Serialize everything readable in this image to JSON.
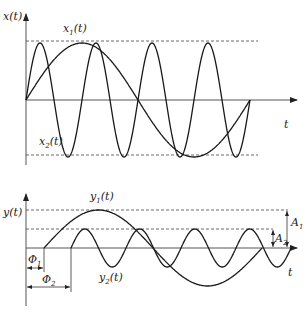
{
  "top_plot": {
    "y_axis_label": "x(t)",
    "x_axis_label": "t",
    "curves": [
      {
        "name": "x1(t)",
        "label_base": "x",
        "label_sub": "1",
        "label_suffix": "(t)",
        "description": "low-frequency sine, one full period"
      },
      {
        "name": "x2(t)",
        "label_base": "x",
        "label_sub": "2",
        "label_suffix": "(t)",
        "description": "high-frequency sine, four periods, same amplitude"
      }
    ]
  },
  "bottom_plot": {
    "y_axis_label": "y(t)",
    "x_axis_label": "t",
    "curves": [
      {
        "name": "y1(t)",
        "label_base": "y",
        "label_sub": "1",
        "label_suffix": "(t)",
        "description": "low-frequency sine, amplitude A1, delayed by Φ1"
      },
      {
        "name": "y2(t)",
        "label_base": "y",
        "label_sub": "2",
        "label_suffix": "(t)",
        "description": "high-frequency sine, amplitude A2, delayed by Φ2"
      }
    ],
    "annotations": {
      "phi1": {
        "base": "Φ",
        "sub": "1"
      },
      "phi2": {
        "base": "Φ",
        "sub": "2"
      },
      "a1": {
        "base": "A",
        "sub": "1"
      },
      "a2": {
        "base": "A",
        "sub": "2"
      }
    }
  }
}
